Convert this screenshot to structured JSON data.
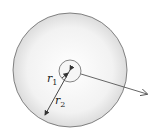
{
  "diagram": {
    "type": "concentric-circles",
    "labels": {
      "r1": {
        "main": "r",
        "sub": "1"
      },
      "r2": {
        "main": "r",
        "sub": "2"
      }
    },
    "colors": {
      "stroke": "#555555",
      "fill_outer": "#ebebeb",
      "fill_center": "#ffffff"
    }
  }
}
